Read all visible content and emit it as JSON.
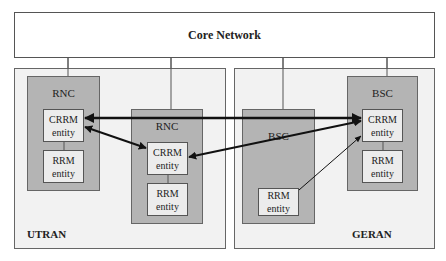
{
  "core_network": {
    "label": "Core Network"
  },
  "utran": {
    "label": "UTRAN",
    "controllers": [
      {
        "label": "RNC",
        "crrm": [
          "CRRM",
          "entity"
        ],
        "rrm": [
          "RRM",
          "entity"
        ]
      },
      {
        "label": "RNC",
        "crrm": [
          "CRRM",
          "entity"
        ],
        "rrm": [
          "RRM",
          "entity"
        ]
      }
    ]
  },
  "geran": {
    "label": "GERAN",
    "controllers": [
      {
        "label": "BSC",
        "rrm": [
          "RRM",
          "entity"
        ]
      },
      {
        "label": "BSC",
        "crrm": [
          "CRRM",
          "entity"
        ],
        "rrm": [
          "RRM",
          "entity"
        ]
      }
    ]
  },
  "links": [
    {
      "from": "RNC1 CRRM entity",
      "to": "BSC2 CRRM entity",
      "style": "bidirectional-thick"
    },
    {
      "from": "RNC1 CRRM entity",
      "to": "RNC2 CRRM entity",
      "style": "bidirectional-thick"
    },
    {
      "from": "RNC2 CRRM entity",
      "to": "BSC2 CRRM entity",
      "style": "bidirectional-thick"
    },
    {
      "from": "BSC1 RRM entity",
      "to": "BSC2 CRRM entity",
      "style": "unidirectional-thin"
    }
  ],
  "colors": {
    "region_fill": "#f2f2f2",
    "controller_fill": "#b4b4b4",
    "entity_fill": "#ececec",
    "line": "#111111"
  }
}
